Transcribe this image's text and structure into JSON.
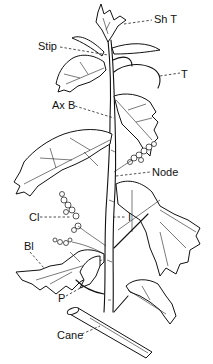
{
  "diagram": {
    "labels": [
      {
        "id": "sh-t",
        "text": "Sh T",
        "x": 154,
        "y": 13
      },
      {
        "id": "stip",
        "text": "Stip",
        "x": 38,
        "y": 40
      },
      {
        "id": "t",
        "text": "T",
        "x": 181,
        "y": 68
      },
      {
        "id": "ax-b",
        "text": "Ax B",
        "x": 52,
        "y": 99
      },
      {
        "id": "node",
        "text": "Node",
        "x": 152,
        "y": 167
      },
      {
        "id": "cl",
        "text": "Cl",
        "x": 29,
        "y": 211
      },
      {
        "id": "i",
        "text": "I",
        "x": 127,
        "y": 211
      },
      {
        "id": "bl",
        "text": "Bl",
        "x": 24,
        "y": 240
      },
      {
        "id": "p",
        "text": "P",
        "x": 58,
        "y": 293
      },
      {
        "id": "cane",
        "text": "Cane",
        "x": 57,
        "y": 330
      }
    ]
  }
}
